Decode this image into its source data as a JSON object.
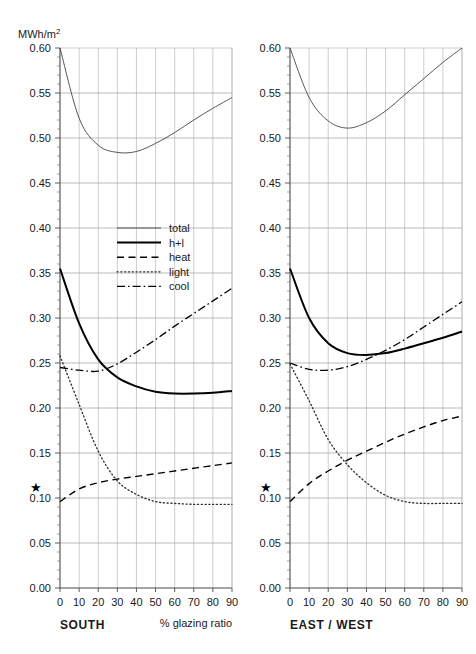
{
  "figure": {
    "unit_label": "MWh/m",
    "unit_superscript": "2",
    "xaxis_title": "% glazing ratio"
  },
  "legend": {
    "position": "inside-left-panel-upper-right",
    "items": [
      {
        "key": "total",
        "label": "total",
        "style": "thin-solid"
      },
      {
        "key": "hl",
        "label": "h+l",
        "style": "thick-solid"
      },
      {
        "key": "heat",
        "label": "heat",
        "style": "dashed"
      },
      {
        "key": "light",
        "label": "light",
        "style": "dotted"
      },
      {
        "key": "cool",
        "label": "cool",
        "style": "dash-dot"
      }
    ]
  },
  "chart_data": [
    {
      "type": "line",
      "title": "SOUTH",
      "panel_label": "SOUTH",
      "xlabel": "% glazing ratio",
      "ylabel": "MWh/m2",
      "xlim": [
        0,
        90
      ],
      "ylim": [
        0.0,
        0.6
      ],
      "xticks": [
        0,
        10,
        20,
        30,
        40,
        50,
        60,
        70,
        80,
        90
      ],
      "yticks": [
        0.0,
        0.05,
        0.1,
        0.15,
        0.2,
        0.25,
        0.3,
        0.35,
        0.4,
        0.45,
        0.5,
        0.55,
        0.6
      ],
      "ytick_labels": [
        "0.00",
        "0.05",
        "0.10",
        "0.15",
        "0.20",
        "0.25",
        "0.30",
        "0.35",
        "0.40",
        "0.45",
        "0.50",
        "0.55",
        "0.60"
      ],
      "y_minor_step": 0.01,
      "grid": true,
      "x": [
        0,
        10,
        20,
        30,
        40,
        50,
        60,
        70,
        80,
        90
      ],
      "series": [
        {
          "name": "total",
          "style": "thin-solid",
          "values": [
            0.6,
            0.522,
            0.492,
            0.484,
            0.485,
            0.494,
            0.506,
            0.52,
            0.533,
            0.545
          ]
        },
        {
          "name": "h+l",
          "style": "thick-solid",
          "values": [
            0.355,
            0.294,
            0.254,
            0.234,
            0.224,
            0.218,
            0.216,
            0.216,
            0.217,
            0.219
          ]
        },
        {
          "name": "heat",
          "style": "dashed",
          "values": [
            0.096,
            0.11,
            0.117,
            0.121,
            0.124,
            0.127,
            0.13,
            0.133,
            0.136,
            0.139
          ]
        },
        {
          "name": "light",
          "style": "dotted",
          "values": [
            0.258,
            0.204,
            0.152,
            0.119,
            0.104,
            0.096,
            0.094,
            0.093,
            0.093,
            0.093
          ]
        },
        {
          "name": "cool",
          "style": "dash-dot",
          "values": [
            0.245,
            0.242,
            0.241,
            0.249,
            0.262,
            0.276,
            0.291,
            0.305,
            0.319,
            0.333
          ]
        }
      ],
      "annotations": [
        {
          "name": "star-marker",
          "glyph": "★",
          "y": 0.112,
          "placement": "outside-left-of-axis"
        }
      ]
    },
    {
      "type": "line",
      "title": "EAST / WEST",
      "panel_label": "EAST / WEST",
      "xlabel": "",
      "ylabel": "",
      "xlim": [
        0,
        90
      ],
      "ylim": [
        0.0,
        0.6
      ],
      "xticks": [
        0,
        10,
        20,
        30,
        40,
        50,
        60,
        70,
        80,
        90
      ],
      "yticks": [
        0.0,
        0.05,
        0.1,
        0.15,
        0.2,
        0.25,
        0.3,
        0.35,
        0.4,
        0.45,
        0.5,
        0.55,
        0.6
      ],
      "ytick_labels": [
        "0.00",
        "0.05",
        "0.10",
        "0.15",
        "0.20",
        "0.25",
        "0.30",
        "0.35",
        "0.40",
        "0.45",
        "0.50",
        "0.55",
        "0.60"
      ],
      "y_minor_step": 0.01,
      "grid": true,
      "x": [
        0,
        10,
        20,
        30,
        40,
        50,
        60,
        70,
        80,
        90
      ],
      "series": [
        {
          "name": "total",
          "style": "thin-solid",
          "values": [
            0.6,
            0.545,
            0.519,
            0.511,
            0.517,
            0.53,
            0.548,
            0.566,
            0.584,
            0.6
          ]
        },
        {
          "name": "h+l",
          "style": "thick-solid",
          "values": [
            0.355,
            0.3,
            0.272,
            0.261,
            0.259,
            0.261,
            0.266,
            0.272,
            0.278,
            0.285
          ]
        },
        {
          "name": "heat",
          "style": "dashed",
          "values": [
            0.096,
            0.116,
            0.13,
            0.142,
            0.152,
            0.162,
            0.171,
            0.179,
            0.186,
            0.191
          ]
        },
        {
          "name": "light",
          "style": "dotted",
          "values": [
            0.249,
            0.208,
            0.165,
            0.137,
            0.117,
            0.103,
            0.096,
            0.094,
            0.094,
            0.094
          ]
        },
        {
          "name": "cool",
          "style": "dash-dot",
          "values": [
            0.25,
            0.243,
            0.242,
            0.246,
            0.254,
            0.264,
            0.276,
            0.29,
            0.304,
            0.318
          ]
        }
      ],
      "annotations": [
        {
          "name": "star-marker",
          "glyph": "★",
          "y": 0.112,
          "placement": "outside-left-of-axis"
        }
      ]
    }
  ]
}
